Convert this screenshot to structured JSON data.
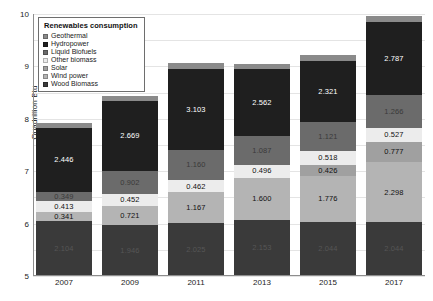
{
  "chart_data": {
    "type": "bar",
    "subtype": "stacked-bar",
    "title": "",
    "xlabel": "",
    "ylabel": "Quadrillion Btu",
    "ylim": [
      0,
      10
    ],
    "ytick_labels": [
      "10",
      "9",
      "8",
      "7",
      "6",
      "5",
      "4",
      "3",
      "2",
      "1",
      "0"
    ],
    "grid": true,
    "legend_position": "top-left",
    "legend_title": "Renewables consumption",
    "categories": [
      "2007",
      "2009",
      "2011",
      "2013",
      "2015",
      "2017"
    ],
    "series": [
      {
        "name": "Wood Biomass",
        "color": "#3a3a3a",
        "values": [
          2.104,
          1.946,
          2.025,
          2.153,
          2.044,
          2.044
        ],
        "labels": [
          "2.104",
          "1.946",
          "2.025",
          "2.153",
          "2.044",
          "2.044"
        ],
        "label_style": "faint-dark"
      },
      {
        "name": "Wind power",
        "color": "#b4b4b4",
        "values": [
          0.341,
          0.721,
          1.167,
          1.6,
          1.776,
          2.298
        ],
        "labels": [
          "0.341",
          "0.721",
          "1.167",
          "1.600",
          "1.776",
          "2.298"
        ],
        "label_style": "dark-on-light"
      },
      {
        "name": "Solar",
        "color": "#a0a0a0",
        "values": [
          0.0,
          0.0,
          0.0,
          0.0,
          0.426,
          0.777
        ],
        "labels": [
          "",
          "",
          "",
          "",
          "0.426",
          "0.777"
        ],
        "label_style": "dark-on-light"
      },
      {
        "name": "Other biomass",
        "color": "#ececec",
        "values": [
          0.413,
          0.452,
          0.462,
          0.496,
          0.518,
          0.527
        ],
        "labels": [
          "0.413",
          "0.452",
          "0.462",
          "0.496",
          "0.518",
          "0.527"
        ],
        "label_style": "dark-on-light"
      },
      {
        "name": "Liquid Biofuels",
        "color": "#6b6b6b",
        "values": [
          0.349,
          0.902,
          1.16,
          1.087,
          1.121,
          1.266
        ],
        "labels": [
          "0.349",
          "0.902",
          "1.160",
          "1.087",
          "1.121",
          "1.266"
        ],
        "label_style": "faint-mid"
      },
      {
        "name": "Hydropower",
        "color": "#1f1f1f",
        "values": [
          2.446,
          2.669,
          3.103,
          2.562,
          2.321,
          2.787
        ],
        "labels": [
          "2.446",
          "2.669",
          "3.103",
          "2.562",
          "2.321",
          "2.787"
        ],
        "label_style": "white-on-dark"
      },
      {
        "name": "Geothermal",
        "color": "#8a8a8a",
        "values": [
          0.186,
          0.2,
          0.212,
          0.214,
          0.224,
          0.21
        ],
        "labels": [
          "",
          "",
          "",
          "",
          "",
          ""
        ],
        "label_style": "none"
      }
    ],
    "totals": [
      "5.939",
      "6.890",
      "8.129",
      "8.112",
      "8.210",
      "9.902"
    ]
  },
  "legend": {
    "title": "Renewables consumption",
    "items": [
      {
        "label": "Geothermal",
        "color": "#8a8a8a"
      },
      {
        "label": "Hydropower",
        "color": "#1f1f1f"
      },
      {
        "label": "Liquid Biofuels",
        "color": "#6b6b6b"
      },
      {
        "label": "Other biomass",
        "color": "#ececec"
      },
      {
        "label": "Solar",
        "color": "#a0a0a0"
      },
      {
        "label": "Wind power",
        "color": "#b4b4b4"
      },
      {
        "label": "Wood Biomass",
        "color": "#3a3a3a"
      }
    ]
  }
}
